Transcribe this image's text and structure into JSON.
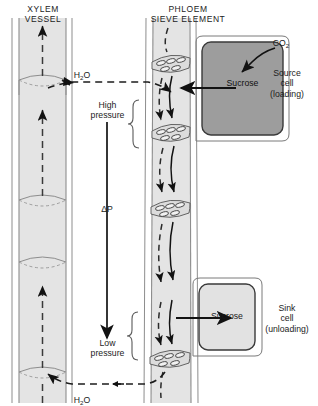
{
  "diagram": {
    "background": "#ffffff",
    "ink": "#1c1c1c"
  },
  "headings": {
    "xylem": "XYLEM\nVESSEL",
    "phloem": "PHLOEM\nSIEVE ELEMENT"
  },
  "labels": {
    "water_top": "H",
    "water_top_sub": "2",
    "water_top_end": "O",
    "water_bottom": "H",
    "water_bottom_sub": "2",
    "water_bottom_end": "O",
    "high_pressure": "High\npressure",
    "delta_p": "ΔP",
    "low_pressure": "Low\npressure",
    "co2": "CO",
    "co2_sub": "2",
    "sucrose_source": "Sucrose",
    "sucrose_sink": "Sucrose",
    "source_cell": "Source\ncell\n(loading)",
    "sink_cell": "Sink\ncell\n(unloading)"
  },
  "colors": {
    "tube_fill": "#e4e4e4",
    "tube_edge": "#8d8d8d",
    "source_cell_fill": "#9d9d9d",
    "source_cell_edge": "#3a3a3a",
    "sink_cell_fill": "#e2e2e2",
    "sink_cell_edge": "#3a3a3a",
    "arrow": "#121212",
    "plate_fill": "#dcdcdc"
  },
  "structures": {
    "xylem_segments": 4,
    "phloem_sieve_plates": 4,
    "xylem_flow_direction": "upward",
    "phloem_flow_direction": "downward"
  }
}
